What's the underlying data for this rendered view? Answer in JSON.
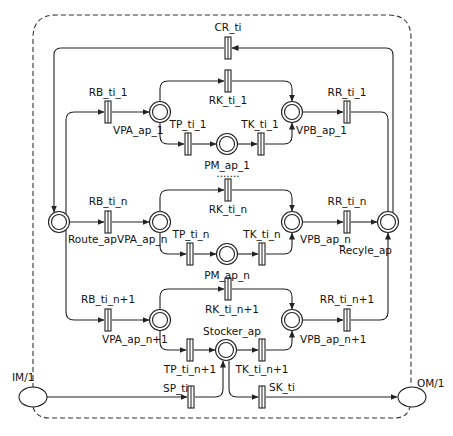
{
  "diagram": {
    "type": "petri-net",
    "colors": {
      "stroke": "#222222",
      "background": "#ffffff"
    },
    "boundary": {
      "style": "dashed-rounded"
    },
    "places": [
      {
        "id": "route_ap",
        "label": "Route_ap",
        "x": 59,
        "y": 222
      },
      {
        "id": "recyle_ap",
        "label": "Recyle_ap",
        "x": 388,
        "y": 222
      },
      {
        "id": "vpa_ap_1",
        "label": "VPA_ap_1",
        "x": 160,
        "y": 112
      },
      {
        "id": "vpb_ap_1",
        "label": "VPB_ap_1",
        "x": 292,
        "y": 112
      },
      {
        "id": "pm_ap_1",
        "label": "PM_ap_1",
        "x": 227,
        "y": 144
      },
      {
        "id": "vpa_ap_n",
        "label": "VPA_ap_n",
        "x": 160,
        "y": 222
      },
      {
        "id": "vpb_ap_n",
        "label": "VPB_ap_n",
        "x": 292,
        "y": 222
      },
      {
        "id": "pm_ap_n",
        "label": "PM_ap_n",
        "x": 227,
        "y": 254
      },
      {
        "id": "vpa_ap_n1",
        "label": "VPA_ap_n+1",
        "x": 160,
        "y": 320
      },
      {
        "id": "vpb_ap_n1",
        "label": "VPB_ap_n+1",
        "x": 292,
        "y": 320
      },
      {
        "id": "stocker_ap",
        "label": "Stocker_ap",
        "x": 226,
        "y": 350
      }
    ],
    "transitions": [
      {
        "id": "cr_ti",
        "label": "CR_ti",
        "x": 228,
        "y": 48
      },
      {
        "id": "rb_ti_1",
        "label": "RB_ti_1",
        "x": 108,
        "y": 112
      },
      {
        "id": "rk_ti_1",
        "label": "RK_ti_1",
        "x": 228,
        "y": 81
      },
      {
        "id": "tp_ti_1",
        "label": "TP_ti_1",
        "x": 188,
        "y": 144
      },
      {
        "id": "tk_ti_1",
        "label": "TK_ti_1",
        "x": 261,
        "y": 144
      },
      {
        "id": "rr_ti_1",
        "label": "RR_ti_1",
        "x": 347,
        "y": 112
      },
      {
        "id": "rb_ti_n",
        "label": "RB_ti_n",
        "x": 108,
        "y": 222
      },
      {
        "id": "rk_ti_n",
        "label": "RK_ti_n",
        "x": 228,
        "y": 190
      },
      {
        "id": "tp_ti_n",
        "label": "TP_ti_n",
        "x": 190,
        "y": 254
      },
      {
        "id": "tk_ti_n",
        "label": "TK_ti_n",
        "x": 262,
        "y": 254
      },
      {
        "id": "rr_ti_n",
        "label": "RR_ti_n",
        "x": 347,
        "y": 222
      },
      {
        "id": "rb_ti_n1",
        "label": "RB_ti_n+1",
        "x": 108,
        "y": 320
      },
      {
        "id": "rk_ti_n1",
        "label": "RK_ti_n+1",
        "x": 228,
        "y": 289
      },
      {
        "id": "tp_ti_n1",
        "label": "TP_ti_n+1",
        "x": 190,
        "y": 350
      },
      {
        "id": "tk_ti_n1",
        "label": "TK_ti_n+1",
        "x": 262,
        "y": 350
      },
      {
        "id": "rr_ti_n1",
        "label": "RR_ti_n+1",
        "x": 347,
        "y": 320
      },
      {
        "id": "sp_ti",
        "label": "SP_ti",
        "x": 191,
        "y": 397
      },
      {
        "id": "sk_ti",
        "label": "SK_ti",
        "x": 262,
        "y": 397
      }
    ],
    "external_ports": [
      {
        "id": "im",
        "label": "IM/1",
        "x": 33,
        "y": 397
      },
      {
        "id": "om",
        "label": "OM/1",
        "x": 412,
        "y": 397
      }
    ],
    "ellipsis": "......."
  }
}
